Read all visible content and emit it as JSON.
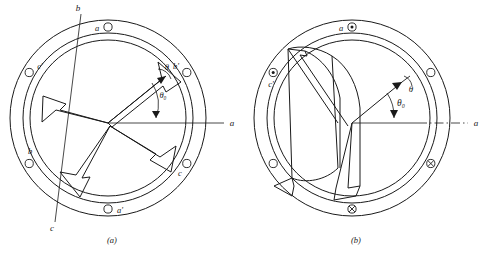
{
  "figure": {
    "caption_a": "(a)",
    "caption_b": "(b)",
    "axis_label_right": "a"
  },
  "diagram_a": {
    "caption": "(a)",
    "axis_labels": {
      "b_axis": "b",
      "c_axis": "c",
      "a_axis": "a"
    },
    "angles": {
      "theta": "θ",
      "theta_zero": "θ₀"
    },
    "slots": [
      {
        "name": "a",
        "label": "a",
        "marker": "open-circle",
        "angle_deg": 90
      },
      {
        "name": "b'",
        "label": "b'",
        "marker": "open-circle",
        "angle_deg": 30
      },
      {
        "name": "c",
        "label": "c",
        "marker": "open-circle",
        "angle_deg": -30
      },
      {
        "name": "a'",
        "label": "a'",
        "marker": "open-circle",
        "angle_deg": -90
      },
      {
        "name": "b",
        "label": "b",
        "marker": "open-circle",
        "angle_deg": -150
      },
      {
        "name": "c'",
        "label": "c'",
        "marker": "open-circle",
        "angle_deg": 150
      }
    ]
  },
  "diagram_b": {
    "caption": "(b)",
    "axis_labels": {
      "a_axis": "a"
    },
    "angles": {
      "theta": "θ",
      "theta_zero": "θ₀"
    },
    "slots": [
      {
        "name": "a",
        "label": "a",
        "marker": "dot-circle",
        "angle_deg": 90
      },
      {
        "name": "s2",
        "label": "",
        "marker": "open-circle",
        "angle_deg": 30
      },
      {
        "name": "s3",
        "label": "",
        "marker": "cross-circle",
        "angle_deg": -30
      },
      {
        "name": "s4",
        "label": "",
        "marker": "cross-circle",
        "angle_deg": -90
      },
      {
        "name": "s5",
        "label": "",
        "marker": "open-circle",
        "angle_deg": -150
      },
      {
        "name": "c'",
        "label": "c'",
        "marker": "dot-circle",
        "angle_deg": 150
      }
    ]
  },
  "colors": {
    "ink": "#1a1a1a",
    "paper": "#ffffff"
  }
}
